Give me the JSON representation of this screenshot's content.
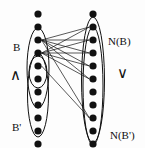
{
  "figure": {
    "type": "bipartite-graph-diagram",
    "width": 145,
    "height": 148,
    "background": "#fdfdfd",
    "ink_color": "#111111"
  },
  "labels": {
    "left_set": "B",
    "left_subset": "B'",
    "right_set": "N(B)",
    "right_subset": "N(B')",
    "left_operator": "∧",
    "right_operator": "∨"
  },
  "label_positions": {
    "left_set": {
      "x": 13,
      "y": 42
    },
    "left_subset": {
      "x": 12,
      "y": 122
    },
    "right_set": {
      "x": 108,
      "y": 36
    },
    "right_subset": {
      "x": 110,
      "y": 130
    },
    "left_operator": {
      "x": 10,
      "y": 68
    },
    "right_operator": {
      "x": 117,
      "y": 66
    }
  },
  "columns": {
    "left": {
      "name": "left-vertex-column",
      "x": 38,
      "dot_radius": 3.6,
      "count": 11,
      "dot_y": [
        14,
        27,
        40,
        53,
        66,
        79,
        92,
        105,
        118,
        131,
        144
      ]
    },
    "right": {
      "name": "right-vertex-column",
      "x": 93,
      "dot_radius": 3.6,
      "count": 11,
      "dot_y": [
        14,
        27,
        40,
        53,
        66,
        79,
        92,
        105,
        118,
        131,
        144
      ]
    }
  },
  "ellipses": [
    {
      "name": "ellipse-B",
      "cx": 38,
      "cy": 68,
      "rx": 11,
      "ry": 40
    },
    {
      "name": "ellipse-B-prime",
      "cx": 38,
      "cy": 95,
      "rx": 10.5,
      "ry": 42
    },
    {
      "name": "ellipse-inner-left",
      "cx": 38,
      "cy": 72,
      "rx": 9,
      "ry": 16
    },
    {
      "name": "ellipse-NB",
      "cx": 93,
      "cy": 80,
      "rx": 11.5,
      "ry": 63
    },
    {
      "name": "ellipse-NB-prime",
      "cx": 93,
      "cy": 86,
      "rx": 10,
      "ry": 59
    }
  ],
  "edges": [
    {
      "from": 2,
      "to": 1
    },
    {
      "from": 2,
      "to": 2
    },
    {
      "from": 2,
      "to": 3
    },
    {
      "from": 2,
      "to": 4
    },
    {
      "from": 2,
      "to": 5
    },
    {
      "from": 3,
      "to": 1
    },
    {
      "from": 3,
      "to": 2
    },
    {
      "from": 3,
      "to": 3
    },
    {
      "from": 3,
      "to": 4
    },
    {
      "from": 3,
      "to": 5
    },
    {
      "from": 4,
      "to": 8
    },
    {
      "from": 2,
      "to": 8
    }
  ]
}
